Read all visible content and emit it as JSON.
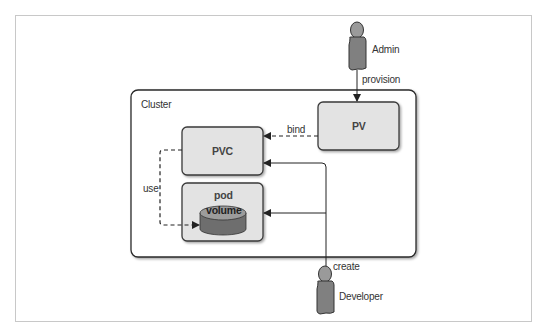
{
  "diagram": {
    "cluster": {
      "label": "Cluster"
    },
    "nodes": {
      "pv": {
        "label": "PV"
      },
      "pvc": {
        "label": "PVC"
      },
      "pod": {
        "label": "pod"
      },
      "volume": {
        "label": "volume"
      }
    },
    "actors": {
      "admin": {
        "label": "Admin"
      },
      "developer": {
        "label": "Developer"
      }
    },
    "edges": {
      "provision": {
        "label": "provision",
        "from": "Admin",
        "to": "PV",
        "style": "solid"
      },
      "bind": {
        "label": "bind",
        "from": "PV",
        "to": "PVC",
        "style": "dashed"
      },
      "use": {
        "label": "use",
        "from": "PVC",
        "to": "volume",
        "style": "dashed"
      },
      "create": {
        "label": "create",
        "from": "Developer",
        "to": [
          "PVC",
          "pod"
        ],
        "style": "solid"
      }
    },
    "colors": {
      "box_fill": "#e3e3e3",
      "box_stroke": "#3a3a3a",
      "person_fill": "#8a8a8a",
      "cylinder_top": "#9c9c9c",
      "cylinder_body": "#6e6e6e"
    }
  }
}
